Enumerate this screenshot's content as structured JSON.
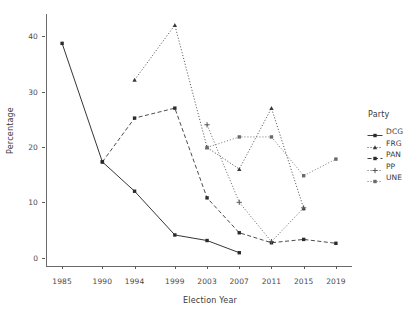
{
  "chart_data": {
    "type": "line",
    "title": "",
    "xlabel": "Election Year",
    "ylabel": "Percentage",
    "categories": [
      "1985",
      "1990",
      "1994",
      "1999",
      "2003",
      "2007",
      "2011",
      "2015",
      "2019"
    ],
    "x": [
      1985,
      1990,
      1994,
      1999,
      2003,
      2007,
      2011,
      2015,
      2019
    ],
    "xtick_labels": [
      "1985",
      "1990",
      "1994",
      "1999",
      "2003",
      "2007",
      "2011",
      "2015",
      "2019"
    ],
    "ytick_labels": [
      "0",
      "10",
      "20",
      "30",
      "40"
    ],
    "ytick_values": [
      0,
      10,
      20,
      30,
      40
    ],
    "ylim": [
      -1.5,
      44
    ],
    "xlim": [
      1983,
      2021
    ],
    "grid": false,
    "legend_position": "right",
    "legend_title": "Party",
    "series": [
      {
        "name": "DCG",
        "line_style": "solid",
        "marker": "square",
        "color": "#2b2b2b",
        "points": [
          {
            "x": 1985,
            "y": 38.7
          },
          {
            "x": 1990,
            "y": 17.3
          },
          {
            "x": 1994,
            "y": 12.0
          },
          {
            "x": 1999,
            "y": 4.1
          },
          {
            "x": 2003,
            "y": 3.1
          },
          {
            "x": 2007,
            "y": 0.9
          }
        ]
      },
      {
        "name": "FRG",
        "line_style": "dotted",
        "marker": "triangle",
        "color": "#3a3a3a",
        "points": [
          {
            "x": 1994,
            "y": 32.1
          },
          {
            "x": 1999,
            "y": 42.0
          },
          {
            "x": 2003,
            "y": 19.9
          },
          {
            "x": 2007,
            "y": 16.0
          },
          {
            "x": 2011,
            "y": 27.0
          },
          {
            "x": 2015,
            "y": 8.9
          }
        ]
      },
      {
        "name": "PAN",
        "line_style": "dashed",
        "marker": "square",
        "color": "#2b2b2b",
        "points": [
          {
            "x": 1990,
            "y": 17.3
          },
          {
            "x": 1994,
            "y": 25.2
          },
          {
            "x": 1999,
            "y": 27.0
          },
          {
            "x": 2003,
            "y": 10.8
          },
          {
            "x": 2007,
            "y": 4.5
          },
          {
            "x": 2011,
            "y": 2.7
          },
          {
            "x": 2015,
            "y": 3.3
          },
          {
            "x": 2019,
            "y": 2.6
          }
        ]
      },
      {
        "name": "PP",
        "line_style": "dotted",
        "marker": "plus",
        "color": "#555555",
        "points": [
          {
            "x": 2003,
            "y": 24.0
          },
          {
            "x": 2007,
            "y": 10.0
          },
          {
            "x": 2011,
            "y": 2.9
          },
          {
            "x": 2015,
            "y": 9.0
          }
        ]
      },
      {
        "name": "UNE",
        "line_style": "dotted",
        "marker": "square",
        "color": "#6a6a6a",
        "points": [
          {
            "x": 2003,
            "y": 19.9
          },
          {
            "x": 2007,
            "y": 21.8
          },
          {
            "x": 2011,
            "y": 21.8
          },
          {
            "x": 2015,
            "y": 14.8
          },
          {
            "x": 2019,
            "y": 17.8
          }
        ]
      }
    ]
  },
  "legend": {
    "title": "Party",
    "items": [
      {
        "label": "DCG"
      },
      {
        "label": "FRG"
      },
      {
        "label": "PAN"
      },
      {
        "label": "PP"
      },
      {
        "label": "UNE"
      }
    ]
  },
  "axes": {
    "x_title": "Election Year",
    "y_title": "Percentage"
  }
}
